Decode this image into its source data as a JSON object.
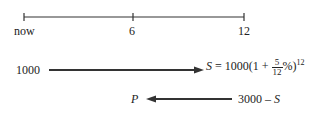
{
  "timeline": {
    "ticks": [
      {
        "label": "now",
        "pos": 0
      },
      {
        "label": "6",
        "pos": 6
      },
      {
        "label": "12",
        "pos": 12
      }
    ]
  },
  "flow1": {
    "start_value": "1000",
    "formula_lhs": "S",
    "formula_eq": "= 1000(1 +",
    "frac_num": "5",
    "frac_den": "12",
    "formula_tail": "%)",
    "exponent": "12"
  },
  "flow2": {
    "end_label": "P",
    "start_value": "3000 –",
    "start_var": "S"
  },
  "colors": {
    "ink": "#222222"
  }
}
